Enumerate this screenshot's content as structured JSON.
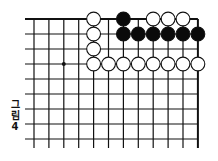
{
  "diagram": {
    "type": "go-board-diagram",
    "caption": [
      "그",
      "림",
      "4"
    ],
    "board": {
      "columns": 12,
      "rows": 9,
      "origin_x": 34,
      "origin_y": 19,
      "spacing_x": 14.9,
      "spacing_y": 15,
      "line_extend_bottom": 9,
      "line_extend_left": 9,
      "top_edge": true,
      "right_edge": true,
      "line_color": "#111111",
      "star_points": [
        {
          "row": 3,
          "col": 2
        }
      ]
    },
    "stones": [
      {
        "color": "white",
        "row": 0,
        "col": 4
      },
      {
        "color": "black",
        "row": 0,
        "col": 6
      },
      {
        "color": "white",
        "row": 0,
        "col": 8
      },
      {
        "color": "white",
        "row": 0,
        "col": 9
      },
      {
        "color": "white",
        "row": 0,
        "col": 10
      },
      {
        "color": "white",
        "row": 1,
        "col": 4
      },
      {
        "color": "black",
        "row": 1,
        "col": 6
      },
      {
        "color": "black",
        "row": 1,
        "col": 7
      },
      {
        "color": "black",
        "row": 1,
        "col": 8
      },
      {
        "color": "black",
        "row": 1,
        "col": 9
      },
      {
        "color": "black",
        "row": 1,
        "col": 10
      },
      {
        "color": "black",
        "row": 1,
        "col": 11
      },
      {
        "color": "white",
        "row": 2,
        "col": 4
      },
      {
        "color": "white",
        "row": 3,
        "col": 4
      },
      {
        "color": "white",
        "row": 3,
        "col": 5
      },
      {
        "color": "white",
        "row": 3,
        "col": 6
      },
      {
        "color": "white",
        "row": 3,
        "col": 7
      },
      {
        "color": "white",
        "row": 3,
        "col": 8
      },
      {
        "color": "white",
        "row": 3,
        "col": 9
      },
      {
        "color": "white",
        "row": 3,
        "col": 10
      },
      {
        "color": "white",
        "row": 3,
        "col": 11
      }
    ]
  }
}
